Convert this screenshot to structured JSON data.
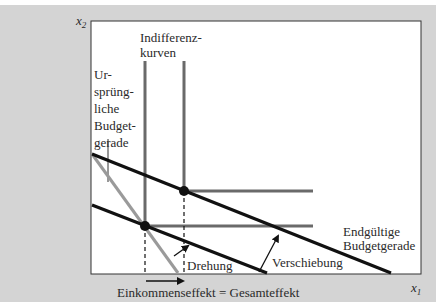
{
  "figure": {
    "axes": {
      "x_label": "x",
      "x_sub": "1",
      "y_label": "x",
      "y_sub": "2"
    },
    "labels": {
      "indifference_line1": "Indifferenz-",
      "indifference_line2": "kurven",
      "original_budget": [
        "Ur-",
        "sprüng-",
        "liche",
        "Budget-",
        "gerade"
      ],
      "final_budget_line1": "Endgültige",
      "final_budget_line2": "Budgetgerade",
      "rotation": "Drehung",
      "shift": "Verschiebung",
      "bottom_caption": "Einkommenseffekt = Gesamteffekt"
    },
    "colors": {
      "background": "#d4d4d4",
      "plot_area": "#ffffff",
      "budget_line": "#111111",
      "rotated_line": "#9a9a9a",
      "indifference_curve": "#6a6a6a"
    }
  }
}
